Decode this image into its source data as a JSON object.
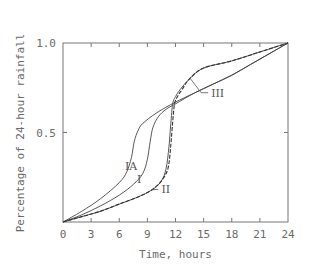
{
  "chart_data": {
    "type": "line",
    "title": "",
    "xlabel": "Time, hours",
    "ylabel": "Percentage of 24-hour rainfall",
    "xlim": [
      0,
      24
    ],
    "ylim": [
      0,
      1.0
    ],
    "x_ticks": [
      0,
      3,
      6,
      9,
      12,
      15,
      18,
      21,
      24
    ],
    "x_tick_labels": [
      "0",
      "3",
      "6",
      "9",
      "12",
      "15",
      "18",
      "21",
      "24"
    ],
    "y_ticks": [
      0.5,
      1.0
    ],
    "y_tick_labels": [
      "0.5",
      "1.0"
    ],
    "grid": false,
    "legend": "none (curves labelled inline)",
    "series": [
      {
        "name": "IA",
        "style": "solid",
        "x": [
          0,
          2,
          4,
          6,
          6.8,
          7.3,
          7.6,
          8.0,
          8.5,
          10,
          12,
          14,
          16,
          18,
          20,
          22,
          24
        ],
        "values": [
          0,
          0.06,
          0.13,
          0.22,
          0.28,
          0.36,
          0.45,
          0.51,
          0.55,
          0.61,
          0.67,
          0.72,
          0.77,
          0.82,
          0.88,
          0.94,
          1.0
        ]
      },
      {
        "name": "I",
        "style": "solid",
        "x": [
          0,
          2,
          4,
          6,
          7.5,
          8.5,
          9.0,
          9.3,
          9.6,
          10.2,
          11,
          12,
          14,
          16,
          18,
          20,
          22,
          24
        ],
        "values": [
          0,
          0.04,
          0.09,
          0.15,
          0.21,
          0.27,
          0.35,
          0.45,
          0.53,
          0.59,
          0.63,
          0.66,
          0.72,
          0.77,
          0.82,
          0.88,
          0.94,
          1.0
        ]
      },
      {
        "name": "II",
        "style": "solid",
        "x": [
          0,
          2,
          4,
          6,
          8,
          9.5,
          10.5,
          11.0,
          11.3,
          11.5,
          11.7,
          12,
          12.5,
          13.5,
          15,
          18,
          21,
          24
        ],
        "values": [
          0,
          0.03,
          0.06,
          0.1,
          0.14,
          0.18,
          0.23,
          0.3,
          0.42,
          0.55,
          0.66,
          0.7,
          0.74,
          0.8,
          0.86,
          0.9,
          0.95,
          1.0
        ]
      },
      {
        "name": "III",
        "style": "dashed",
        "x": [
          0,
          2,
          4,
          6,
          8,
          9.5,
          10.5,
          11.2,
          11.5,
          11.7,
          11.9,
          12.2,
          12.7,
          13.5,
          15,
          18,
          21,
          24
        ],
        "values": [
          0,
          0.03,
          0.06,
          0.1,
          0.14,
          0.18,
          0.23,
          0.3,
          0.43,
          0.56,
          0.66,
          0.7,
          0.74,
          0.8,
          0.86,
          0.9,
          0.95,
          1.0
        ]
      }
    ],
    "annotations": [
      {
        "text": "IA",
        "x": 6.6,
        "y": 0.29
      },
      {
        "text": "I",
        "x": 7.9,
        "y": 0.22
      },
      {
        "text": "II",
        "x": 10.5,
        "y": 0.16,
        "pointer_to": [
          9.5,
          0.18
        ]
      },
      {
        "text": "III",
        "x": 15.8,
        "y": 0.7,
        "pointer_to": [
          13.6,
          0.8
        ]
      }
    ]
  }
}
